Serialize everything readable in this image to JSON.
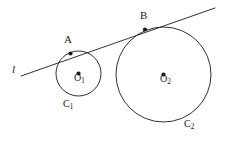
{
  "figure": {
    "kind": "geometry-diagram",
    "background_color": "#ffffff",
    "stroke_color": "#1a1a1a",
    "text_color": "#1a1a1a",
    "width": 225,
    "height": 147
  },
  "labels": {
    "tangent_line": "l",
    "point_a": "A",
    "point_b": "B",
    "center_one_base": "O",
    "center_one_sub": "1",
    "center_two_base": "O",
    "center_two_sub": "2",
    "circle_one_base": "C",
    "circle_one_sub": "1",
    "circle_two_base": "C",
    "circle_two_sub": "2"
  },
  "geometry": {
    "circle_one": {
      "cx": 78.5,
      "cy": 73.5,
      "r": 22.5
    },
    "circle_two": {
      "cx": 163.5,
      "cy": 74.5,
      "r": 47.5
    },
    "tangent_line": {
      "x1": 21,
      "y1": 76,
      "x2": 215,
      "y2": 8
    },
    "tangent_point_a": {
      "x": 70.5,
      "y": 53.5
    },
    "tangent_point_b": {
      "x": 145.0,
      "y": 29.5
    },
    "center_dot_one": {
      "x": 78.5,
      "y": 73.5
    },
    "center_dot_two": {
      "x": 163.5,
      "y": 74.5
    },
    "dot_radius": 2.1,
    "stroke_width": 0.9
  },
  "label_positions": {
    "tangent_line": {
      "x": 12,
      "y": 64
    },
    "point_a": {
      "x": 64,
      "y": 34
    },
    "point_b": {
      "x": 140,
      "y": 10
    },
    "center_one": {
      "x": 74,
      "y": 73
    },
    "center_two": {
      "x": 160,
      "y": 74
    },
    "circle_one": {
      "x": 63,
      "y": 99
    },
    "circle_two": {
      "x": 184,
      "y": 119
    }
  }
}
